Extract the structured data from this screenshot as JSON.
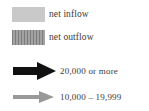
{
  "legend": {
    "title": "",
    "colors": {
      "net_inflow_swatch": "#c9c9c9",
      "net_outflow_swatch_dark": "#7d7d7d",
      "net_outflow_swatch_light": "#a2a2a2",
      "major_arrow": "#111111",
      "minor_arrow": "#999999",
      "text": "#3c3a38",
      "background": "#ffffff"
    },
    "swatch_items": [
      {
        "icon": "solid-gray-swatch",
        "label": "net inflow"
      },
      {
        "icon": "vertical-striped-gray-swatch",
        "label": "net outflow"
      }
    ],
    "arrow_items": [
      {
        "icon": "thick-black-right-arrow",
        "label": "20,000 or more"
      },
      {
        "icon": "thin-gray-right-arrow",
        "label": "10,000 – 19,999"
      }
    ]
  }
}
